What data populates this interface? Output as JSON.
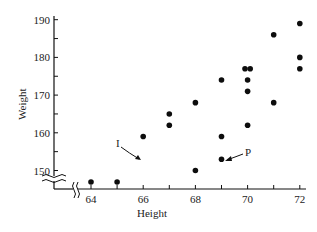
{
  "chart_data": {
    "type": "scatter",
    "title": "",
    "xlabel": "Height",
    "ylabel": "Weight",
    "xlim": [
      63,
      72
    ],
    "ylim": [
      145,
      190
    ],
    "x_ticks": [
      64,
      65,
      66,
      67,
      68,
      69,
      70,
      71,
      72
    ],
    "x_tick_labels": [
      "64",
      "",
      "66",
      "",
      "68",
      "",
      "70",
      "",
      "72"
    ],
    "y_ticks": [
      150,
      155,
      160,
      165,
      170,
      175,
      180,
      185,
      190
    ],
    "y_tick_labels": [
      "150",
      "",
      "160",
      "",
      "170",
      "",
      "180",
      "",
      "190"
    ],
    "grid": false,
    "legend": null,
    "axis_breaks": {
      "x": "between origin and 64",
      "y": "between origin and 150"
    },
    "points": [
      {
        "x": 64,
        "y": 146
      },
      {
        "x": 65,
        "y": 146
      },
      {
        "x": 66,
        "y": 159,
        "label": "I"
      },
      {
        "x": 67,
        "y": 162
      },
      {
        "x": 67,
        "y": 165
      },
      {
        "x": 68,
        "y": 150
      },
      {
        "x": 68,
        "y": 168
      },
      {
        "x": 69,
        "y": 153,
        "label": "P"
      },
      {
        "x": 69,
        "y": 159
      },
      {
        "x": 69,
        "y": 174
      },
      {
        "x": 70,
        "y": 162
      },
      {
        "x": 70,
        "y": 171
      },
      {
        "x": 70,
        "y": 174
      },
      {
        "x": 69.9,
        "y": 177
      },
      {
        "x": 70.1,
        "y": 177
      },
      {
        "x": 71,
        "y": 168
      },
      {
        "x": 71,
        "y": 186
      },
      {
        "x": 72,
        "y": 177
      },
      {
        "x": 72,
        "y": 180
      },
      {
        "x": 72,
        "y": 189
      }
    ],
    "annotations": [
      {
        "text": "I",
        "point": {
          "x": 66,
          "y": 159
        },
        "arrow": true
      },
      {
        "text": "P",
        "point": {
          "x": 69,
          "y": 153
        },
        "arrow": true
      }
    ]
  },
  "labels": {
    "x_axis_title": "Height",
    "y_axis_title": "Weight",
    "annotation_i": "I",
    "annotation_p": "P"
  }
}
